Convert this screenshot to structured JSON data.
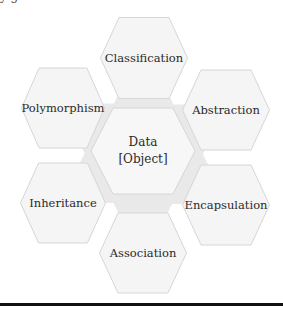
{
  "diagram": {
    "title_fragment": "y  g",
    "colors": {
      "hex_fill": "#f5f5f5",
      "hex_fill_center": "#f7f7f7",
      "hex_stroke": "#d6d6d6",
      "filler": "#e9e9e9",
      "text": "#2a2a2a",
      "rule": "#111111"
    },
    "center": {
      "id": "data-object",
      "lines": [
        "Data",
        "[Object]"
      ],
      "cx": 143,
      "cy": 151,
      "w": 104,
      "h": 86
    },
    "hexes": [
      {
        "id": "classification",
        "label": "Classification",
        "cx": 144,
        "cy": 58,
        "w": 87,
        "h": 81
      },
      {
        "id": "abstraction",
        "label": "Abstraction",
        "cx": 226,
        "cy": 110,
        "w": 87,
        "h": 80
      },
      {
        "id": "encapsulation",
        "label": "Encapsulation",
        "cx": 226,
        "cy": 205,
        "w": 87,
        "h": 80
      },
      {
        "id": "association",
        "label": "Association",
        "cx": 143,
        "cy": 253,
        "w": 87,
        "h": 80
      },
      {
        "id": "inheritance",
        "label": "Inheritance",
        "cx": 63,
        "cy": 203,
        "w": 85,
        "h": 80
      },
      {
        "id": "polymorphism",
        "label": "Polymorphism",
        "cx": 63,
        "cy": 108,
        "w": 83,
        "h": 80
      }
    ]
  }
}
